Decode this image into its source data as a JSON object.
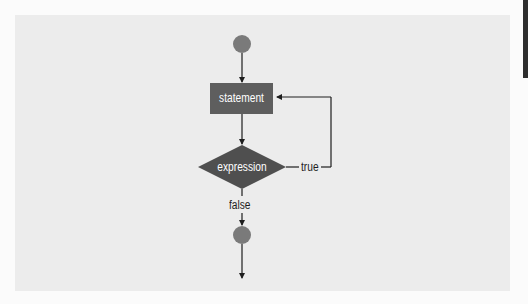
{
  "diagram": {
    "type": "flowchart",
    "title": "",
    "colors": {
      "page": "#fbfbfb",
      "panel": "#ececec",
      "terminal_circle": "#7a7a7a",
      "statement_box": "#5e5e5e",
      "decision_diamond": "#4f4f4f",
      "line": "#1e1e1e",
      "node_text": "#ffffff",
      "edge_tab": "#2e2e2e"
    },
    "nodes": [
      {
        "id": "start",
        "shape": "circle",
        "label": ""
      },
      {
        "id": "statement",
        "shape": "rectangle",
        "label": "statement"
      },
      {
        "id": "expression",
        "shape": "diamond",
        "label": "expression"
      },
      {
        "id": "end",
        "shape": "circle",
        "label": ""
      }
    ],
    "edges": [
      {
        "from": "start",
        "to": "statement",
        "label": ""
      },
      {
        "from": "statement",
        "to": "expression",
        "label": ""
      },
      {
        "from": "expression",
        "to": "statement",
        "label": "true"
      },
      {
        "from": "expression",
        "to": "end",
        "label": "false"
      },
      {
        "from": "end",
        "to": "exit",
        "label": ""
      }
    ],
    "labels": {
      "statement": "statement",
      "expression": "expression",
      "true": "true",
      "false": "false"
    }
  }
}
